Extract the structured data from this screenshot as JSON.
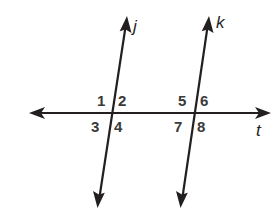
{
  "diagram": {
    "type": "parallel-lines-with-transversal",
    "colors": {
      "stroke": "#231f20",
      "label": "#3a3a3a",
      "background": "#ffffff"
    },
    "lines": [
      {
        "id": "j",
        "label": "j",
        "from": [
          98,
          207
        ],
        "to": [
          127,
          17
        ],
        "label_pos": [
          133,
          32
        ]
      },
      {
        "id": "k",
        "label": "k",
        "from": [
          181,
          207
        ],
        "to": [
          209,
          17
        ],
        "label_pos": [
          216,
          28
        ]
      },
      {
        "id": "t",
        "label": "t",
        "from": [
          30,
          113
        ],
        "to": [
          270,
          113
        ],
        "label_pos": [
          256,
          136
        ]
      }
    ],
    "intersections": [
      {
        "lines": [
          "j",
          "t"
        ],
        "point": [
          112,
          113
        ]
      },
      {
        "lines": [
          "k",
          "t"
        ],
        "point": [
          194,
          113
        ]
      }
    ],
    "angles": [
      {
        "label": "1",
        "pos": [
          97,
          106
        ]
      },
      {
        "label": "2",
        "pos": [
          118,
          106
        ]
      },
      {
        "label": "3",
        "pos": [
          91,
          132
        ]
      },
      {
        "label": "4",
        "pos": [
          114,
          132
        ]
      },
      {
        "label": "5",
        "pos": [
          178,
          106
        ]
      },
      {
        "label": "6",
        "pos": [
          200,
          106
        ]
      },
      {
        "label": "7",
        "pos": [
          174,
          132
        ]
      },
      {
        "label": "8",
        "pos": [
          197,
          132
        ]
      }
    ]
  }
}
